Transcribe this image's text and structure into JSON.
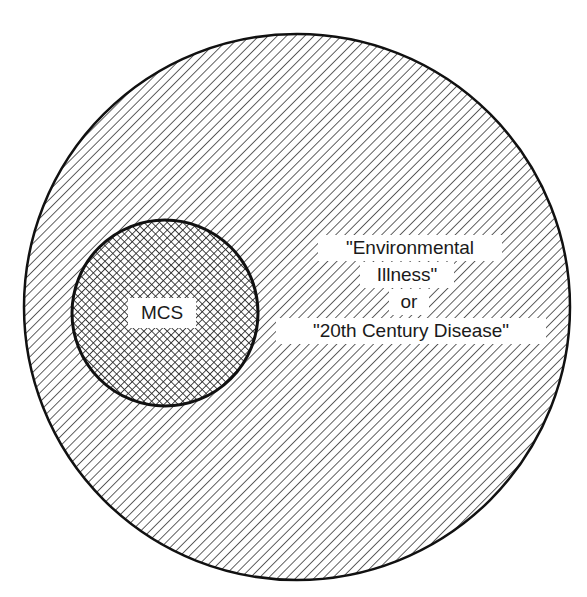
{
  "diagram": {
    "type": "nested-set (Venn/Euler) diagram",
    "outer_set": {
      "lines": [
        "\"Environmental",
        "Illness\"",
        "or",
        "\"20th Century Disease\""
      ],
      "full_label": "\"Environmental Illness\" or \"20th Century Disease\"",
      "fill_pattern": "diagonal-hatch",
      "stroke_color": "#111111"
    },
    "inner_set": {
      "label": "MCS",
      "fill_pattern": "cross-hatch",
      "stroke_color": "#111111"
    },
    "relationship": "MCS is a subset contained within \"Environmental Illness\" / \"20th Century Disease\""
  }
}
